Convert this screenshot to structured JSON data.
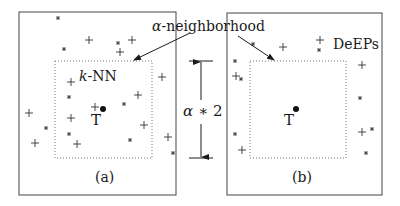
{
  "figure": {
    "panels": [
      {
        "id": "a",
        "caption": "(a)",
        "method_label_prefix": "k",
        "method_label_suffix": "-NN",
        "test_label": "T",
        "outer_box": {
          "x": 19,
          "y": 12,
          "w": 157,
          "h": 183
        },
        "neighborhood_box": {
          "x": 55,
          "y": 61,
          "w": 97,
          "h": 97
        },
        "test_point": {
          "x": 103,
          "y": 109
        },
        "plus_points": [
          [
            89,
            40
          ],
          [
            132,
            40
          ],
          [
            120,
            52
          ],
          [
            71,
            82
          ],
          [
            95,
            107
          ],
          [
            138,
            95
          ],
          [
            162,
            77
          ],
          [
            29,
            113
          ],
          [
            71,
            118
          ],
          [
            77,
            144
          ],
          [
            144,
            125
          ],
          [
            168,
            137
          ],
          [
            35,
            143
          ]
        ],
        "star_points": [
          [
            58,
            18
          ],
          [
            118,
            43
          ],
          [
            64,
            49
          ],
          [
            69,
            97
          ],
          [
            124,
            104
          ],
          [
            46,
            128
          ],
          [
            69,
            134
          ],
          [
            130,
            140
          ],
          [
            173,
            153
          ]
        ]
      },
      {
        "id": "b",
        "caption": "(b)",
        "method_label": "DeEPs",
        "test_label": "T",
        "outer_box": {
          "x": 227,
          "y": 13,
          "w": 155,
          "h": 182
        },
        "neighborhood_box": {
          "x": 250,
          "y": 61,
          "w": 96,
          "h": 97
        },
        "test_point": {
          "x": 296,
          "y": 109
        },
        "plus_points": [
          [
            283,
            47
          ],
          [
            320,
            40
          ],
          [
            236,
            76
          ],
          [
            362,
            65
          ],
          [
            362,
            132
          ],
          [
            242,
            150
          ]
        ],
        "star_points": [
          [
            253,
            44
          ],
          [
            319,
            50
          ],
          [
            235,
            61
          ],
          [
            241,
            79
          ],
          [
            360,
            98
          ],
          [
            372,
            129
          ],
          [
            366,
            153
          ],
          [
            235,
            134
          ]
        ]
      }
    ],
    "shared_label": {
      "alpha": "α",
      "text_suffix": "-neighborhood"
    },
    "dimension": {
      "alpha": "α",
      "operator": "∗",
      "factor": "2",
      "x": 201,
      "y_top": 61,
      "y_bottom": 158
    },
    "colors": {
      "ink": "#1a1a1a",
      "dotted": "#777777",
      "box": "#444444"
    }
  }
}
